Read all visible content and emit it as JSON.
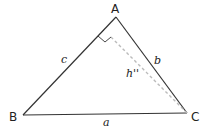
{
  "diagram": {
    "colors": {
      "stroke": "#333333",
      "altitude": "#bbbbbb",
      "text": "#222222",
      "background": "#ffffff"
    },
    "vertices": {
      "A": {
        "label": "A",
        "x": 116,
        "y": 17
      },
      "B": {
        "label": "B",
        "x": 23,
        "y": 115
      },
      "C": {
        "label": "C",
        "x": 187,
        "y": 113
      }
    },
    "sides": {
      "a": {
        "label": "a",
        "between": "B-C"
      },
      "b": {
        "label": "b",
        "between": "A-C"
      },
      "c": {
        "label": "c",
        "between": "A-B"
      }
    },
    "altitude": {
      "label": "h''",
      "from": "C",
      "to_side": "c",
      "style": "dashed"
    },
    "right_angle_marker": true
  }
}
